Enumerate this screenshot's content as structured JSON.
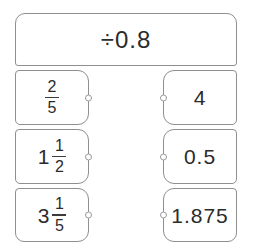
{
  "exercise": {
    "type": "matching-tiles",
    "rule": {
      "label": "÷0.8"
    },
    "left_column": {
      "tiles": [
        {
          "whole": "",
          "numerator": "2",
          "denominator": "5"
        },
        {
          "whole": "1",
          "numerator": "1",
          "denominator": "2"
        },
        {
          "whole": "3",
          "numerator": "1",
          "denominator": "5"
        }
      ]
    },
    "right_column": {
      "tiles": [
        {
          "value": "4"
        },
        {
          "value": "0.5"
        },
        {
          "value": "1.875"
        }
      ]
    },
    "connector_dot_count": 6
  },
  "colors": {
    "tile_border": "#8f8f8f",
    "text": "#2b2b2b",
    "background": "#ffffff",
    "dot_border": "#9a9a9a"
  }
}
